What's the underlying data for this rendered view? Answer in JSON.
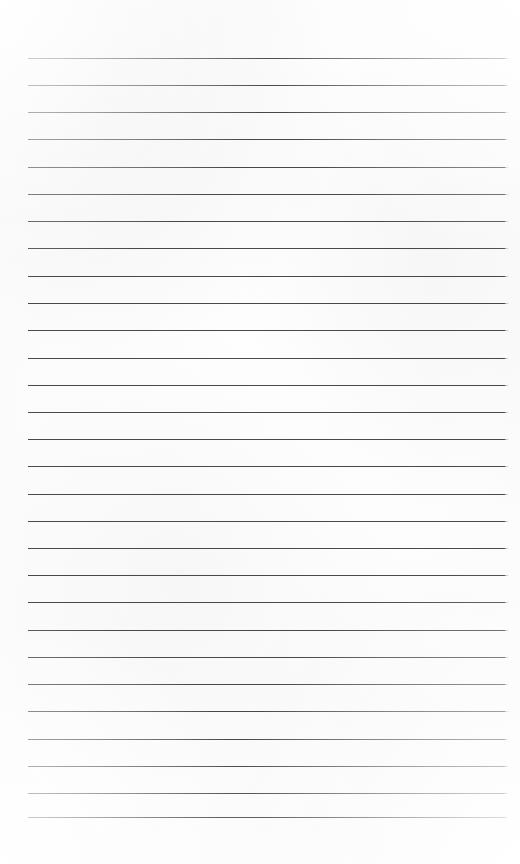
{
  "page": {
    "kind": "ruled-notepad-page",
    "width_px": 520,
    "height_px": 864,
    "paper_color": "#fcfcfc",
    "paper_edge_color": "#ffffff",
    "content_text": ""
  },
  "rules": {
    "count": 29,
    "color": "#3a3a3e",
    "thickness_px": 1.3,
    "opacity": 0.92,
    "left_x_px": 28,
    "right_x_px": 505,
    "length_px": 477,
    "first_line_y_px": 58,
    "last_line_y_px": 817,
    "spacing_px": 27.1,
    "y_positions": [
      58,
      85,
      112,
      139,
      167,
      194,
      221,
      248,
      276,
      303,
      330,
      358,
      385,
      412,
      439,
      466,
      494,
      521,
      548,
      575,
      602,
      630,
      657,
      684,
      711,
      739,
      766,
      793,
      817
    ]
  },
  "margins": {
    "top_px": 58,
    "bottom_px": 47,
    "left_px": 28,
    "right_px": 15
  }
}
